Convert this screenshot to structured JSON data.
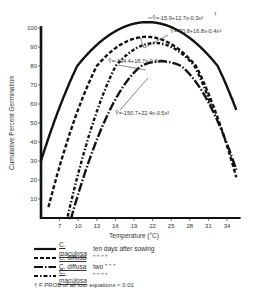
{
  "chart_data": {
    "type": "line",
    "title": "",
    "xlabel": "Temperature (°C)",
    "ylabel": "Cumulative Percent Germination",
    "xticks": [
      7,
      10,
      13,
      16,
      19,
      22,
      25,
      28,
      31,
      34
    ],
    "yticks": [
      10,
      20,
      30,
      40,
      50,
      60,
      70,
      80,
      90,
      100
    ],
    "xlim": [
      4,
      36
    ],
    "ylim": [
      0,
      105
    ],
    "grid": false,
    "legend_position": "bottom-left",
    "series": [
      {
        "name": "C. maculosa ten days after sowing",
        "equation": "Ŷ=-15.9+12.7x-0.3x²",
        "a": -15.9,
        "b": 12.7,
        "c": -0.3,
        "style": "solid",
        "xrange": [
          4,
          35.5
        ]
      },
      {
        "name": "C. diffusa ten days after sowing",
        "equation": "Ŷ=-70.8+16.8x-0.4x²",
        "a": -70.8,
        "b": 16.8,
        "c": -0.4,
        "style": "dashed",
        "xrange": [
          5.2,
          35.5
        ]
      },
      {
        "name": "C. diffusa two days after sowing",
        "equation": "Ŷ=-134.4+18.7x-0.4x²",
        "a": -134.4,
        "b": 18.7,
        "c": -0.4,
        "style": "longdash-dot",
        "xrange": [
          8.6,
          35.5
        ]
      },
      {
        "name": "C. maculosa two days after sowing",
        "equation": "Ŷ=-150.7+22.4x-0.5x²",
        "a": -150.7,
        "b": 22.4,
        "c": -0.5,
        "style": "dash-dot",
        "xrange": [
          8.3,
          31.6
        ]
      }
    ],
    "annotations": [
      "Ŷ=-15.9+12.7x-0.3x² †",
      "Ŷ=-70.8+16.8x-0.4x²",
      "Ŷ=-134.4+18.7x-0.4x²",
      "Ŷ=-150.7+22.4x-0.5x²"
    ]
  },
  "labels": {
    "xlabel": "Temperature (°C)",
    "ylabel": "Cumulative Percent Germination",
    "eq1": "Ŷ=-15.9+12.7x-0.3x²",
    "eq1_mark": "†",
    "eq2": "Ŷ=-70.8+16.8x-0.4x²",
    "eq3": "Ŷ=-134.4+18.7x-0.4x²",
    "eq4": "Ŷ=-150.7+22.4x-0.5x²"
  },
  "legend": {
    "rows": [
      {
        "species": "C. maculosa",
        "condition": "ten days after sowing"
      },
      {
        "species": "C. diffusa",
        "condition": "\"    \"    \"    \""
      },
      {
        "species": "C. diffusa",
        "condition": "two  \"    \"    \""
      },
      {
        "species": "C. maculosa",
        "condition": "\"    \"    \"    \""
      }
    ],
    "note": "† F PROB of all four equations < 0.01"
  }
}
